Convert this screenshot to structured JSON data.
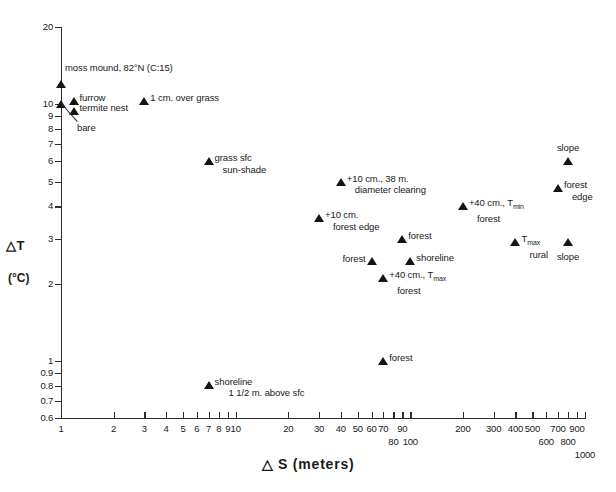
{
  "chart_data": {
    "type": "scatter",
    "title": "",
    "xlabel": "△ S (meters)",
    "ylabel_line1": "△T",
    "ylabel_line2": "(°C)",
    "xscale": "log",
    "yscale": "log",
    "xlim": [
      1,
      1000
    ],
    "ylim": [
      0.6,
      20
    ],
    "grid": false,
    "legend": "none",
    "xticks": [
      {
        "value": 1,
        "label": "1",
        "row": 0
      },
      {
        "value": 2,
        "label": "2",
        "row": 0
      },
      {
        "value": 3,
        "label": "3",
        "row": 0
      },
      {
        "value": 4,
        "label": "4",
        "row": 0
      },
      {
        "value": 5,
        "label": "5",
        "row": 0
      },
      {
        "value": 6,
        "label": "6",
        "row": 0
      },
      {
        "value": 7,
        "label": "7",
        "row": 0
      },
      {
        "value": 8,
        "label": "8",
        "row": 0
      },
      {
        "value": 9,
        "label": "9",
        "row": 0
      },
      {
        "value": 10,
        "label": "10",
        "row": 0
      },
      {
        "value": 20,
        "label": "20",
        "row": 0
      },
      {
        "value": 30,
        "label": "30",
        "row": 0
      },
      {
        "value": 40,
        "label": "40",
        "row": 0
      },
      {
        "value": 50,
        "label": "50",
        "row": 0
      },
      {
        "value": 60,
        "label": "60",
        "row": 0
      },
      {
        "value": 70,
        "label": "70",
        "row": 0
      },
      {
        "value": 80,
        "label": "80",
        "row": 1
      },
      {
        "value": 90,
        "label": "90",
        "row": 0
      },
      {
        "value": 100,
        "label": "100",
        "row": 1
      },
      {
        "value": 200,
        "label": "200",
        "row": 0
      },
      {
        "value": 300,
        "label": "300",
        "row": 0
      },
      {
        "value": 400,
        "label": "400",
        "row": 0
      },
      {
        "value": 500,
        "label": "500",
        "row": 0
      },
      {
        "value": 600,
        "label": "600",
        "row": 1
      },
      {
        "value": 700,
        "label": "700",
        "row": 0
      },
      {
        "value": 800,
        "label": "800",
        "row": 1
      },
      {
        "value": 900,
        "label": "900",
        "row": 0
      },
      {
        "value": 1000,
        "label": "1000",
        "row": 2
      }
    ],
    "yticks": [
      {
        "value": 20,
        "label": "20"
      },
      {
        "value": 10,
        "label": "10"
      },
      {
        "value": 9,
        "label": "9"
      },
      {
        "value": 8,
        "label": "8"
      },
      {
        "value": 7,
        "label": "7"
      },
      {
        "value": 6,
        "label": "6"
      },
      {
        "value": 5,
        "label": "5"
      },
      {
        "value": 4,
        "label": "4"
      },
      {
        "value": 3,
        "label": "3"
      },
      {
        "value": 2,
        "label": "2"
      },
      {
        "value": 1,
        "label": "1"
      },
      {
        "value": 0.9,
        "label": "0.9"
      },
      {
        "value": 0.8,
        "label": "0.8"
      },
      {
        "value": 0.7,
        "label": "0.7"
      },
      {
        "value": 0.6,
        "label": "0.6"
      }
    ],
    "points": [
      {
        "id": "moss-mound",
        "x": 1.0,
        "y": 12.0,
        "label_line1": "moss mound, 82°N (C:15)",
        "label_line2": "",
        "placement": "above-right"
      },
      {
        "id": "furrow",
        "x": 1.18,
        "y": 10.3,
        "label_line1": "furrow",
        "label_line2": "",
        "placement": "right"
      },
      {
        "id": "termite-nest",
        "x": 1.18,
        "y": 9.4,
        "label_line1": "termite nest",
        "label_line2": "",
        "placement": "right"
      },
      {
        "id": "bare",
        "x": 1.0,
        "y": 10.0,
        "label_line1": "bare",
        "label_line2": "",
        "placement": "leader"
      },
      {
        "id": "one-cm-over-grass",
        "x": 3.0,
        "y": 10.3,
        "label_line1": "1 cm. over grass",
        "label_line2": "",
        "placement": "right"
      },
      {
        "id": "grass-sfc",
        "x": 7.0,
        "y": 6.0,
        "label_line1": "grass sfc",
        "label_line2": "sun-shade",
        "placement": "right-indent"
      },
      {
        "id": "clearing-38m",
        "x": 40.0,
        "y": 5.0,
        "label_line1": "+10 cm., 38 m.",
        "label_line2": "diameter clearing",
        "placement": "right-indent"
      },
      {
        "id": "plus10-forest-edge",
        "x": 30.0,
        "y": 3.6,
        "label_line1": "+10 cm.",
        "label_line2": "forest edge",
        "placement": "right-indent"
      },
      {
        "id": "plus40-tmin-forest",
        "x": 200.0,
        "y": 4.0,
        "label_line1": "+40 cm., Tₘᵢₙ",
        "label_line2": "forest",
        "placement": "right-indent"
      },
      {
        "id": "forest-mid",
        "x": 90.0,
        "y": 3.0,
        "label_line1": "forest",
        "label_line2": "",
        "placement": "right"
      },
      {
        "id": "tmax-rural",
        "x": 400.0,
        "y": 2.9,
        "label_line1": "Tₘₐₓ",
        "label_line2": "rural",
        "placement": "right-indent"
      },
      {
        "id": "forest-left",
        "x": 60.0,
        "y": 2.45,
        "label_line1": "forest",
        "label_line2": "",
        "placement": "left"
      },
      {
        "id": "shoreline-mid",
        "x": 100.0,
        "y": 2.45,
        "label_line1": "shoreline",
        "label_line2": "",
        "placement": "right"
      },
      {
        "id": "plus40-tmax-forest",
        "x": 70.0,
        "y": 2.1,
        "label_line1": "+40 cm., Tₘₐₓ",
        "label_line2": "forest",
        "placement": "right-indent"
      },
      {
        "id": "slope-upper",
        "x": 800.0,
        "y": 6.0,
        "label_line1": "slope",
        "label_line2": "",
        "placement": "above"
      },
      {
        "id": "forest-edge-right",
        "x": 700.0,
        "y": 4.7,
        "label_line1": "forest",
        "label_line2": "edge",
        "placement": "right-indent"
      },
      {
        "id": "slope-lower",
        "x": 800.0,
        "y": 2.9,
        "label_line1": "slope",
        "label_line2": "",
        "placement": "below"
      },
      {
        "id": "forest-low",
        "x": 70.0,
        "y": 1.0,
        "label_line1": "forest",
        "label_line2": "",
        "placement": "right"
      },
      {
        "id": "shoreline-low",
        "x": 7.0,
        "y": 0.81,
        "label_line1": "shoreline",
        "label_line2": "1 1/2 m. above sfc",
        "placement": "right-indent2"
      }
    ]
  },
  "colors": {
    "marker": "#141414",
    "axis": "#2b2b2b",
    "background": "#ffffff"
  }
}
